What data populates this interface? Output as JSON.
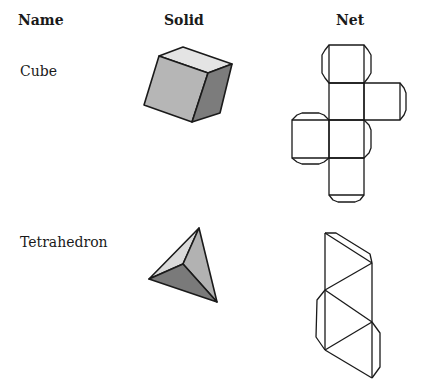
{
  "headers": {
    "name": "Name",
    "solid": "Solid",
    "net": "Net"
  },
  "rows": [
    {
      "name": "Cube",
      "solid_icon": "cube-solid",
      "net_icon": "cube-net"
    },
    {
      "name": "Tetrahedron",
      "solid_icon": "tetrahedron-solid",
      "net_icon": "tetrahedron-net"
    }
  ],
  "colors": {
    "outline": "#1a1a1a",
    "cube_top": "#e4e4e4",
    "cube_front": "#b6b6b6",
    "cube_right": "#7c7c7c",
    "tetra_left": "#dadada",
    "tetra_right": "#b2b2b2",
    "tetra_bottom": "#7a7a7a"
  }
}
